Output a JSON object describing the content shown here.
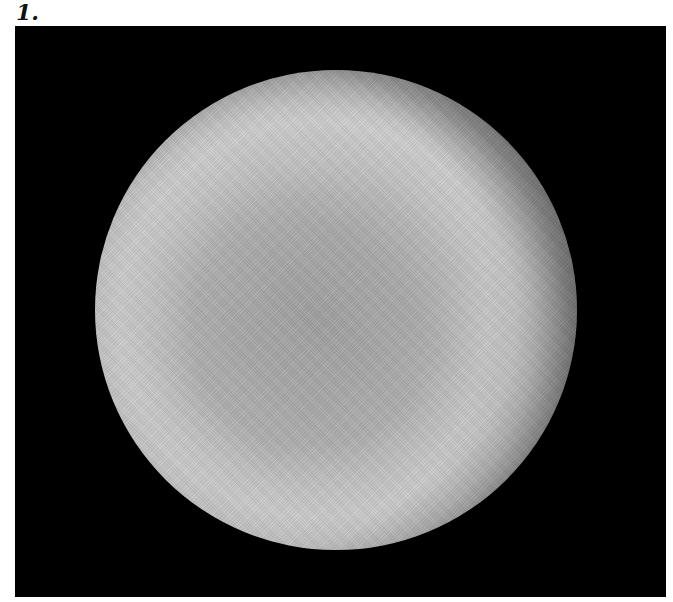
{
  "figure": {
    "panel_label": "1.",
    "image": {
      "description": "Grayscale circular disc (microscopy-style image) on black background with bright annular ring",
      "background_color": "#000000",
      "disc_brightest_color": "#d0d0d0",
      "disc_center_color": "#a0a0a0"
    }
  }
}
